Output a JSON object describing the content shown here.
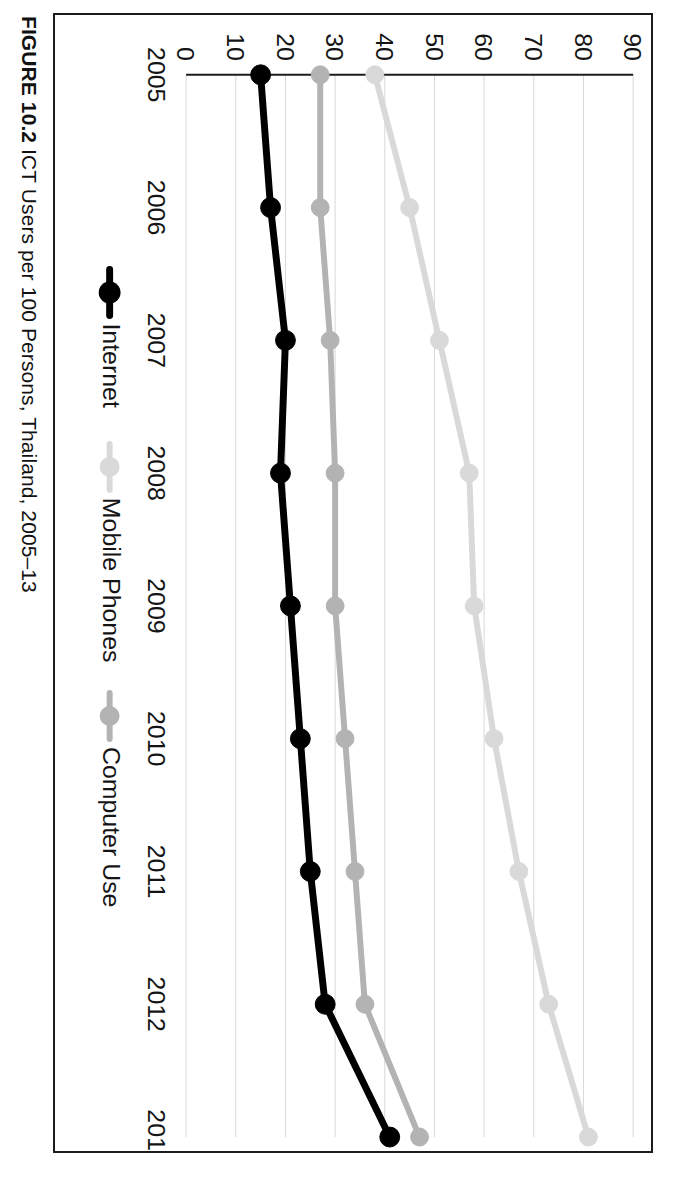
{
  "figure": {
    "caption_label": "FIGURE 10.2",
    "caption_text": "ICT Users per 100 Persons, Thailand, 2005–13"
  },
  "colors": {
    "internet": "#000000",
    "mobile_phones": "#d9d9d9",
    "computer_use": "#b3b3b3",
    "gridline": "#d8d8d8",
    "axis": "#1c1c1c",
    "frame": "#1c1c1c",
    "background": "#ffffff"
  },
  "chart_data": {
    "type": "line",
    "title": "ICT Users per 100 Persons, Thailand, 2005–13",
    "xlabel": "",
    "ylabel": "",
    "categories": [
      "2005",
      "2006",
      "2007",
      "2008",
      "2009",
      "2010",
      "2011",
      "2012",
      "2013"
    ],
    "x": [
      2005,
      2006,
      2007,
      2008,
      2009,
      2010,
      2011,
      2012,
      2013
    ],
    "ylim": [
      0,
      90
    ],
    "yticks": [
      0,
      10,
      20,
      30,
      40,
      50,
      60,
      70,
      80,
      90
    ],
    "ytick_labels": [
      "0",
      "10",
      "20",
      "30",
      "40",
      "50",
      "60",
      "70",
      "80",
      "90"
    ],
    "grid": true,
    "grid_axis": "y",
    "legend_position": "bottom",
    "orientation": "rotated-90-clockwise",
    "series": [
      {
        "name": "Internet",
        "color": "#000000",
        "marker": "circle",
        "values": [
          15,
          17,
          20,
          19,
          21,
          23,
          25,
          28,
          41
        ]
      },
      {
        "name": "Mobile Phones",
        "color": "#d9d9d9",
        "marker": "circle",
        "values": [
          38,
          45,
          51,
          57,
          58,
          62,
          67,
          73,
          81
        ]
      },
      {
        "name": "Computer Use",
        "color": "#b3b3b3",
        "marker": "circle",
        "values": [
          27,
          27,
          29,
          30,
          30,
          32,
          34,
          36,
          47
        ]
      }
    ]
  }
}
